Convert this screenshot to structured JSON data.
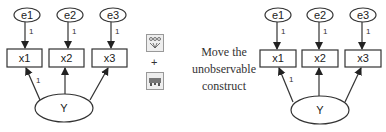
{
  "left_diagram": {
    "errors": [
      {
        "label": "e1"
      },
      {
        "label": "e2"
      },
      {
        "label": "e3"
      }
    ],
    "error_weights": [
      "1",
      "1",
      "1"
    ],
    "indicators": [
      {
        "label": "x1"
      },
      {
        "label": "x2"
      },
      {
        "label": "x3"
      }
    ],
    "construct": {
      "label": "Y"
    },
    "loading_label": "1"
  },
  "right_diagram": {
    "errors": [
      {
        "label": "e1"
      },
      {
        "label": "e2"
      },
      {
        "label": "e3"
      }
    ],
    "error_weights": [
      "1",
      "1",
      "1"
    ],
    "indicators": [
      {
        "label": "x1"
      },
      {
        "label": "x2"
      },
      {
        "label": "x3"
      }
    ],
    "construct": {
      "label": "Y"
    },
    "loading_label": "1"
  },
  "middle": {
    "icons": [
      "indicator-tree-icon",
      "move-object-icon"
    ],
    "plus": "+",
    "caption_lines": [
      "Move the",
      "unobservable",
      "construct"
    ]
  },
  "colors": {
    "stroke": "#333333",
    "background": "#ffffff",
    "text": "#222222"
  }
}
